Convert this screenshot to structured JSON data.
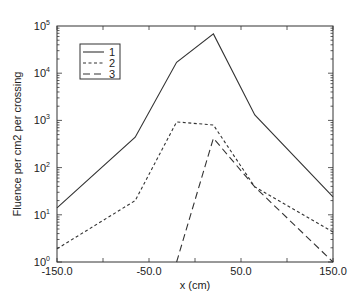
{
  "chart_data": {
    "type": "line",
    "title": "",
    "xlabel": "x (cm)",
    "ylabel": "Fluence per cm2 per crossing",
    "xlim": [
      -150,
      150
    ],
    "ylim": [
      1,
      100000
    ],
    "yscale": "log",
    "grid": false,
    "legend_position": "upper left",
    "x_ticks": [
      -150,
      -100,
      -50,
      0,
      50,
      100,
      150
    ],
    "x_tick_labels": [
      "-150.0",
      "",
      "-50.0",
      "",
      "50.0",
      "",
      "150.0"
    ],
    "y_ticks": [
      1,
      10,
      100,
      1000,
      10000,
      100000
    ],
    "y_tick_labels": [
      {
        "base": "10",
        "exp": "0"
      },
      {
        "base": "10",
        "exp": "1"
      },
      {
        "base": "10",
        "exp": "2"
      },
      {
        "base": "10",
        "exp": "3"
      },
      {
        "base": "10",
        "exp": "4"
      },
      {
        "base": "10",
        "exp": "5"
      }
    ],
    "series": [
      {
        "name": "1",
        "style": "solid",
        "x": [
          -150,
          -65,
          -20,
          20,
          65,
          150
        ],
        "y": [
          14,
          440,
          17000,
          68000,
          1300,
          24
        ]
      },
      {
        "name": "2",
        "style": "short-dash",
        "x": [
          -150,
          -65,
          -20,
          20,
          65,
          150
        ],
        "y": [
          1.9,
          20,
          930,
          800,
          39,
          4.3
        ]
      },
      {
        "name": "3",
        "style": "long-dash",
        "x": [
          -20,
          20,
          65,
          150
        ],
        "y": [
          1,
          420,
          39,
          1
        ]
      }
    ]
  }
}
